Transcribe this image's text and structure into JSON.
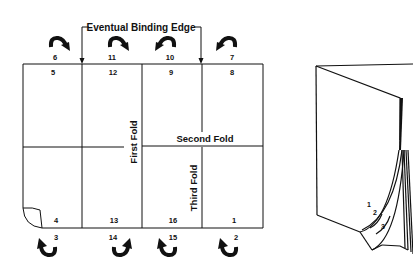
{
  "diagram": {
    "title": "Eventual Binding Edge",
    "fold_labels": {
      "first": "First Fold",
      "second": "Second Fold",
      "third": "Third Fold"
    },
    "sheet": {
      "top_row_pages": [
        "5",
        "12",
        "9",
        "8"
      ],
      "bottom_row_pages": [
        "4",
        "13",
        "16",
        "1"
      ],
      "top_back_pages": [
        "6",
        "11",
        "10",
        "7"
      ],
      "bottom_back_pages": [
        "3",
        "14",
        "15",
        "2"
      ]
    },
    "book": {
      "page_labels": [
        "1",
        "2",
        "3"
      ]
    },
    "colors": {
      "ink": "#111111",
      "paper": "#ffffff"
    }
  }
}
